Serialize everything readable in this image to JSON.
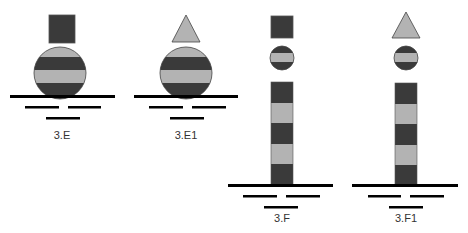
{
  "colors": {
    "dark": "#3a3a3a",
    "light": "#b3b3b3",
    "line": "#000000",
    "stroke": "#555555"
  },
  "figures": [
    {
      "id": "3.E",
      "label": "3.E",
      "topmark": "square",
      "body": "spherical-buoy",
      "bands": [
        "light",
        "dark",
        "light",
        "dark"
      ]
    },
    {
      "id": "3.E1",
      "label": "3.E1",
      "topmark": "triangle",
      "body": "spherical-buoy",
      "bands": [
        "light",
        "dark",
        "light",
        "dark"
      ]
    },
    {
      "id": "3.F",
      "label": "3.F",
      "topmark": "square",
      "secondary_mark": "banded-sphere",
      "body": "pillar",
      "bands": [
        "dark",
        "light",
        "dark",
        "light",
        "dark"
      ]
    },
    {
      "id": "3.F1",
      "label": "3.F1",
      "topmark": "triangle",
      "secondary_mark": "banded-sphere",
      "body": "pillar",
      "bands": [
        "dark",
        "light",
        "dark",
        "light",
        "dark"
      ]
    }
  ]
}
